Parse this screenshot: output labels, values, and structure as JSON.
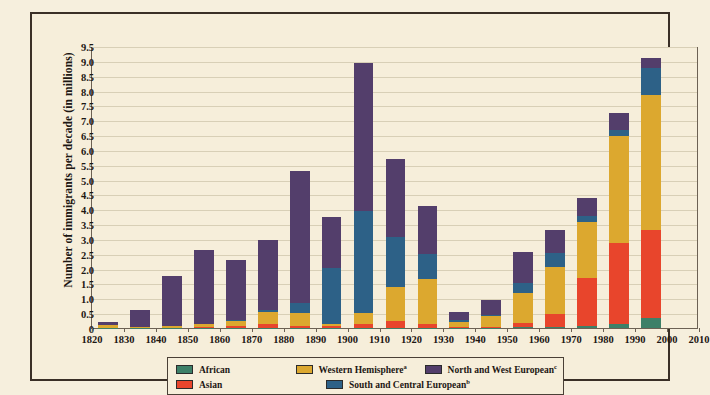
{
  "chart_data": {
    "type": "bar",
    "title": "",
    "subtitle": "",
    "xlabel": "",
    "ylabel": "Number of immigrants per decade (in millions)",
    "ylim": [
      0,
      9.5
    ],
    "ytick_values": [
      0,
      0.5,
      1.0,
      1.5,
      2.0,
      2.5,
      3.0,
      3.5,
      4.0,
      4.5,
      5.0,
      5.5,
      6.0,
      6.5,
      7.0,
      7.5,
      8.0,
      8.5,
      9.0,
      9.5
    ],
    "ytick_labels": [
      "0",
      "0.5",
      "1.0",
      "1.5",
      "2.0",
      "2.5",
      "3.0",
      "3.5",
      "4.0",
      "4.5",
      "5.0",
      "5.5",
      "6.0",
      "6.5",
      "7.0",
      "7.5",
      "8.0",
      "8.5",
      "9.0",
      "9.5"
    ],
    "xtick_labels": [
      "1820",
      "1830",
      "1840",
      "1850",
      "1860",
      "1870",
      "1880",
      "1890",
      "1900",
      "1910",
      "1920",
      "1930",
      "1940",
      "1950",
      "1960",
      "1970",
      "1980",
      "1990",
      "2000",
      "2010"
    ],
    "grid": true,
    "stacked": true,
    "legend_position": "bottom",
    "categories": [
      "1820s",
      "1830s",
      "1840s",
      "1850s",
      "1860s",
      "1870s",
      "1880s",
      "1890s",
      "1900s",
      "1910s",
      "1920s",
      "1930s",
      "1940s",
      "1950s",
      "1960s",
      "1970s",
      "1980s",
      "1990s"
    ],
    "series": [
      {
        "name": "African",
        "color": "#3d8068",
        "values": [
          0.01,
          0.01,
          0.01,
          0.01,
          0.01,
          0.01,
          0.01,
          0.01,
          0.01,
          0.01,
          0.01,
          0.01,
          0.01,
          0.02,
          0.03,
          0.08,
          0.14,
          0.35
        ]
      },
      {
        "name": "Asian",
        "color": "#e8452c",
        "values": [
          0.0,
          0.0,
          0.0,
          0.04,
          0.06,
          0.12,
          0.07,
          0.07,
          0.14,
          0.24,
          0.11,
          0.02,
          0.03,
          0.15,
          0.43,
          1.59,
          2.74,
          2.95
        ]
      },
      {
        "name": "Western Hemisphere",
        "color": "#dca82f",
        "values": [
          0.1,
          0.04,
          0.06,
          0.07,
          0.17,
          0.4,
          0.43,
          0.04,
          0.36,
          1.14,
          1.52,
          0.16,
          0.35,
          1.0,
          1.6,
          1.9,
          3.58,
          4.55
        ]
      },
      {
        "name": "South and Central European",
        "color": "#2d6187",
        "values": [
          0.0,
          0.0,
          0.0,
          0.02,
          0.03,
          0.07,
          0.34,
          1.92,
          3.43,
          1.67,
          0.85,
          0.07,
          0.05,
          0.35,
          0.47,
          0.2,
          0.2,
          0.9
        ]
      },
      {
        "name": "North and West European",
        "color": "#533e6b",
        "values": [
          0.1,
          0.55,
          1.68,
          2.5,
          2.02,
          2.38,
          4.44,
          1.71,
          4.98,
          2.64,
          1.61,
          0.29,
          0.52,
          1.05,
          0.78,
          0.6,
          0.6,
          0.35
        ]
      }
    ]
  },
  "legend": {
    "entries": [
      {
        "label": "African",
        "sup": "",
        "color": "#3d8068"
      },
      {
        "label": "Asian",
        "sup": "",
        "color": "#e8452c"
      },
      {
        "label": "Western Hemisphere",
        "sup": "a",
        "color": "#dca82f"
      },
      {
        "label": "South and Central European",
        "sup": "b",
        "color": "#2d6187"
      },
      {
        "label": "North and West European",
        "sup": "c",
        "color": "#533e6b"
      }
    ]
  },
  "colors": {
    "page_background": "#f6efdd",
    "plot_background": "#f6eeda",
    "frame_border": "#3a2f26",
    "axis": "#6c6154",
    "gridline": "#d8cfb6",
    "text": "#1d1713"
  }
}
